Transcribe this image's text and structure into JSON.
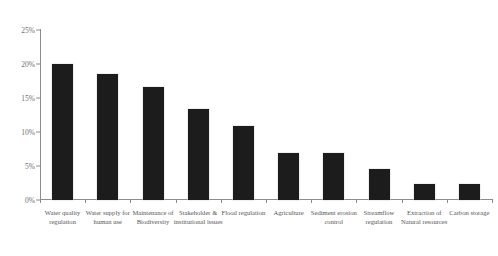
{
  "chart_data": {
    "type": "bar",
    "title": "",
    "title_note": "clipped/illegible title strip at top edge",
    "xlabel": "",
    "ylabel": "",
    "ylim": [
      0,
      25
    ],
    "ytick_labels": [
      "25%",
      "20%",
      "15%",
      "10%",
      "5%",
      "0%"
    ],
    "ytick_values": [
      25,
      20,
      15,
      10,
      5,
      0
    ],
    "grid": false,
    "legend": null,
    "categories": [
      "Water quality regulation",
      "Water supply for human use",
      "Maintenance of Biodiversity",
      "Stakeholder & institutional issues",
      "Flood regulation",
      "Agriculture",
      "Sediment erosion control",
      "Streamflow regulation",
      "Extraction of Natural resources",
      "Carbon storage"
    ],
    "values": [
      20.0,
      18.6,
      16.6,
      13.4,
      10.9,
      6.9,
      6.9,
      4.6,
      2.3,
      2.3
    ],
    "value_labels": [
      "20%",
      "18.6%",
      "16.6%",
      "13.4%",
      "10.9%",
      "6.9%",
      "6.9%",
      "4.6%",
      "2.3%",
      "2.3%"
    ],
    "bar_color": "#1c1c1c",
    "axis_color": "#8c8c8c"
  },
  "axis": {
    "y_ticks": [
      {
        "label": "25%",
        "value": 25
      },
      {
        "label": "20%",
        "value": 20
      },
      {
        "label": "15%",
        "value": 15
      },
      {
        "label": "10%",
        "value": 10
      },
      {
        "label": "5%",
        "value": 5
      },
      {
        "label": "0%",
        "value": 0
      }
    ]
  },
  "title": {
    "text": ""
  }
}
